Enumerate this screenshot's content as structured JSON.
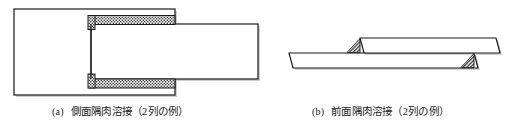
{
  "figure": {
    "background_color": "#ffffff",
    "line_color": "#1a1a1a",
    "plate_fill": "#ffffff",
    "weld_fill": "#f2f2f2",
    "weld_hatch_color": "#3a3a3a",
    "shadow_color": "#9a9a9a",
    "panels": [
      {
        "id": "panel-a",
        "tag": "(a)",
        "caption": "側面隅肉溶接（2列の例）",
        "view": "plan",
        "description": "側面隅肉溶接",
        "rows": "2列",
        "parts": [
          {
            "name": "back-plate",
            "kind": "rectangle",
            "x": 14,
            "y": 9,
            "width": 161,
            "height": 86
          },
          {
            "name": "front-plate",
            "kind": "rectangle",
            "x": 91,
            "y": 24,
            "width": 167,
            "height": 55
          }
        ],
        "welds": [
          {
            "name": "weld-bead-upper",
            "kind": "hatched-bar",
            "x": 88,
            "y": 16,
            "width": 86,
            "height": 8,
            "rows": 1
          },
          {
            "name": "weld-bead-lower",
            "kind": "hatched-bar",
            "x": 88,
            "y": 79,
            "width": 86,
            "height": 8,
            "rows": 1
          },
          {
            "name": "weld-end-upper",
            "kind": "hatched-bar",
            "x": 88,
            "y": 16,
            "width": 7,
            "height": 14,
            "rows": 1
          },
          {
            "name": "weld-end-lower",
            "kind": "hatched-bar",
            "x": 88,
            "y": 73,
            "width": 7,
            "height": 14,
            "rows": 1
          }
        ]
      },
      {
        "id": "panel-b",
        "tag": "(b)",
        "caption": "前面隅肉溶接（2列の例）",
        "view": "elevation",
        "description": "前面隅肉溶接",
        "rows": "2列",
        "parts": [
          {
            "name": "lower-plate",
            "kind": "parallelogram",
            "points": "289,53 474,53 478,68 293,68"
          },
          {
            "name": "upper-plate",
            "kind": "parallelogram",
            "points": "360,38 496,38 500,53 364,53"
          }
        ],
        "welds": [
          {
            "name": "weld-triangle-left",
            "kind": "hatched-triangle",
            "points": "360,38 360,52 347,52"
          },
          {
            "name": "weld-triangle-right",
            "kind": "hatched-triangle",
            "points": "474,53 474,67 461,67"
          }
        ]
      }
    ]
  }
}
